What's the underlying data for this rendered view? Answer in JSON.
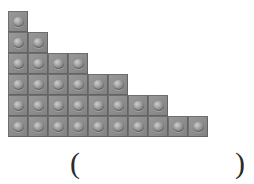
{
  "page": {
    "background_color": "#ffffff",
    "width": 254,
    "height": 184
  },
  "ghost_text": {
    "note": "faded illegible watermark text at top of page",
    "line1": "",
    "line2": "",
    "line3": ""
  },
  "figure": {
    "name": "block-staircase",
    "block_color": "#8e8e8e",
    "block_border_color": "#6f6f6f",
    "stud_color": "#a9a9a9",
    "block_width_px": 20,
    "block_height_px": 21,
    "row_counts": [
      1,
      2,
      4,
      6,
      8,
      10
    ],
    "total_blocks": 31,
    "rows": [
      {
        "index": 1,
        "count": 1
      },
      {
        "index": 2,
        "count": 2
      },
      {
        "index": 3,
        "count": 4
      },
      {
        "index": 4,
        "count": 6
      },
      {
        "index": 5,
        "count": 8
      },
      {
        "index": 6,
        "count": 10
      }
    ]
  },
  "answer": {
    "open_paren": "(",
    "close_paren": ")",
    "value": "",
    "placeholder": ""
  }
}
